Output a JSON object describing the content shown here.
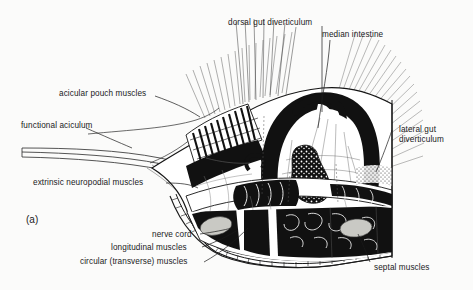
{
  "figure": {
    "panel_label": "(a)",
    "background_color": "#fbfbfa",
    "ink_color": "#111111"
  },
  "labels": {
    "dorsal_gut_diverticulum": "dorsal gut diverticulum",
    "median_intestine": "median intestine",
    "acicular_pouch_muscles": "acicular pouch muscles",
    "functional_aciculum": "functional aciculum",
    "extrinsic_neuropodial_muscles": "extrinsic neuropodial muscles",
    "lateral_gut_diverticulum_line1": "lateral gut",
    "lateral_gut_diverticulum_line2": "diverticulum",
    "nerve_cord": "nerve cord",
    "longitudinal_muscles": "longitudinal muscles",
    "circular_transverse_muscles": "circular (transverse) muscles",
    "septal_muscles": "septal muscles"
  }
}
